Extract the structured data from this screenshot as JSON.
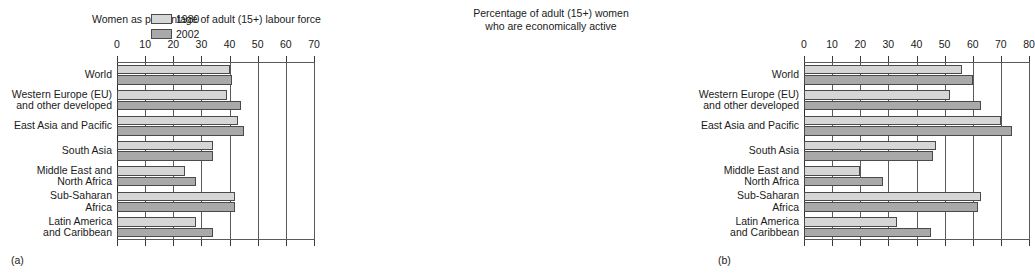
{
  "figure": {
    "panels": [
      {
        "caption": "(a)",
        "title": "Women as percentage of adult (15+) labour force",
        "xlim": [
          0,
          70
        ],
        "xticks": [
          0,
          10,
          20,
          30,
          40,
          50,
          60,
          70
        ],
        "legend": [
          {
            "label": "1980",
            "color": "#d6d6d6"
          },
          {
            "label": "2002",
            "color": "#a9a9a9"
          }
        ]
      },
      {
        "caption": "(b)",
        "title": "Percentage of adult (15+) women\nwho are economically active",
        "xlim": [
          0,
          80
        ],
        "xticks": [
          0,
          10,
          20,
          30,
          40,
          50,
          60,
          70,
          80
        ],
        "legend": []
      }
    ]
  },
  "chart_data": [
    {
      "type": "bar",
      "orientation": "horizontal",
      "title": "Women as percentage of adult (15+) labour force",
      "xlabel": "",
      "ylabel": "",
      "xlim": [
        0,
        70
      ],
      "xticks": [
        0,
        10,
        20,
        30,
        40,
        50,
        60,
        70
      ],
      "grid": true,
      "legend_position": "top-right",
      "categories": [
        "World",
        "Western Europe (EU)\nand other developed",
        "East Asia and Pacific",
        "South Asia",
        "Middle East and\nNorth Africa",
        "Sub-Saharan\nAfrica",
        "Latin America\nand Caribbean"
      ],
      "series": [
        {
          "name": "1980",
          "color": "#d6d6d6",
          "values": [
            40,
            39,
            43,
            34,
            24,
            42,
            28
          ]
        },
        {
          "name": "2002",
          "color": "#a9a9a9",
          "values": [
            41,
            44,
            45,
            34,
            28,
            42,
            34
          ]
        }
      ]
    },
    {
      "type": "bar",
      "orientation": "horizontal",
      "title": "Percentage of adult (15+) women who are economically active",
      "xlabel": "",
      "ylabel": "",
      "xlim": [
        0,
        80
      ],
      "xticks": [
        0,
        10,
        20,
        30,
        40,
        50,
        60,
        70,
        80
      ],
      "grid": true,
      "legend_position": "none",
      "categories": [
        "World",
        "Western Europe (EU)\nand other developed",
        "East Asia and Pacific",
        "South Asia",
        "Middle East and\nNorth Africa",
        "Sub-Saharan\nAfrica",
        "Latin America\nand Caribbean"
      ],
      "series": [
        {
          "name": "1980",
          "color": "#d6d6d6",
          "values": [
            56,
            52,
            70,
            47,
            20,
            63,
            33
          ]
        },
        {
          "name": "2002",
          "color": "#a9a9a9",
          "values": [
            60,
            63,
            74,
            46,
            28,
            62,
            45
          ]
        }
      ]
    }
  ]
}
